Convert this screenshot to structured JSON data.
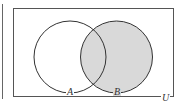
{
  "diagram": {
    "type": "venn",
    "universe_label": "U",
    "sets": [
      {
        "name": "A",
        "label": "A",
        "shaded": false
      },
      {
        "name": "B",
        "label": "B",
        "shaded": true
      }
    ],
    "shaded_region": "B",
    "colors": {
      "stroke": "#333333",
      "shade": "#d9d9d9",
      "background": "#ffffff",
      "frame": "#555555"
    }
  }
}
